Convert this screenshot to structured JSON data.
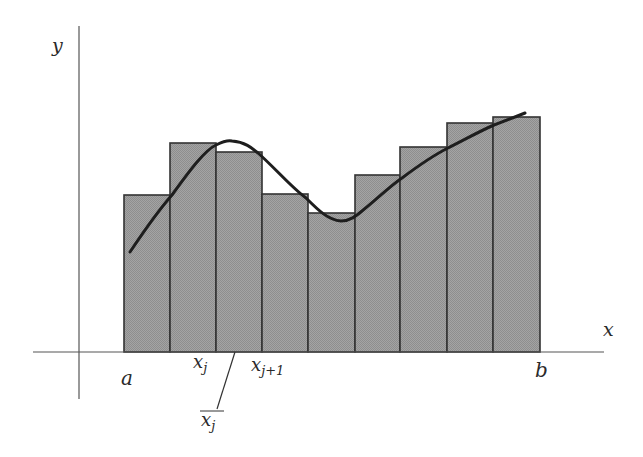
{
  "diagram": {
    "colors": {
      "axis": "#555555",
      "bar_fill": "#9c9c9c",
      "bar_stroke": "#333333",
      "curve": "#1e1e1e",
      "text": "#2a2a2a"
    },
    "axes": {
      "x_label": "x",
      "y_label": "y",
      "x_axis": {
        "x1": 33,
        "x2": 604,
        "y": 352
      },
      "y_axis": {
        "x": 79,
        "y1": 26,
        "y2": 399
      }
    },
    "bars": [
      {
        "left": 124,
        "right": 170,
        "top": 195
      },
      {
        "left": 170,
        "right": 216,
        "top": 143
      },
      {
        "left": 216,
        "right": 262,
        "top": 152
      },
      {
        "left": 262,
        "right": 308,
        "top": 194
      },
      {
        "left": 308,
        "right": 355,
        "top": 213
      },
      {
        "left": 355,
        "right": 400,
        "top": 175
      },
      {
        "left": 400,
        "right": 447,
        "top": 147
      },
      {
        "left": 447,
        "right": 493,
        "top": 123
      },
      {
        "left": 493,
        "right": 540,
        "top": 117
      }
    ],
    "curve_path": "M130,252 C150,222 165,203 172,195 C190,170 205,150 216,145 C222,142 228,140 232,141 C245,142 252,148 258,153 C275,168 292,188 306,198 C318,210 328,220 341,221 C350,221 356,216 362,211 C376,200 390,186 402,178 C418,166 432,156 448,148 C466,139 480,131 494,125 C505,121 515,117 525,113",
    "labels": {
      "a": {
        "text": "a",
        "x": 121,
        "y": 385
      },
      "b": {
        "text": "b",
        "x": 535,
        "y": 377
      },
      "x_j": {
        "main": "x",
        "sub": "j",
        "x": 193,
        "y": 368
      },
      "x_j1": {
        "main": "x",
        "sub": "j+1",
        "x": 251,
        "y": 371
      },
      "x_j_bar": {
        "main": "x",
        "sub": "j",
        "x": 201,
        "y": 426,
        "overline": {
          "x1": 200,
          "x2": 224,
          "y": 411
        }
      },
      "pointer": {
        "x1": 235,
        "y1": 352,
        "x2": 217,
        "y2": 409
      }
    }
  }
}
